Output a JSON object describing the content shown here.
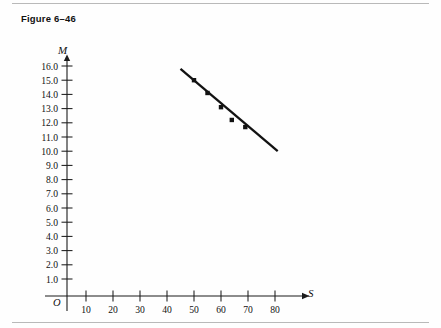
{
  "figure": {
    "caption": "Figure 6–46"
  },
  "axes": {
    "y_label": "M",
    "x_label": "S",
    "origin_label": "O"
  },
  "chart_data": {
    "type": "scatter",
    "title": "Figure 6–46",
    "xlabel": "S",
    "ylabel": "M",
    "grid": false,
    "legend": "none",
    "xlim": [
      0,
      90
    ],
    "ylim": [
      0,
      16.8
    ],
    "x_ticks": [
      10,
      20,
      30,
      40,
      50,
      60,
      70,
      80
    ],
    "x_tick_labels": [
      "10",
      "20",
      "30",
      "40",
      "50",
      "60",
      "70",
      "80"
    ],
    "y_ticks": [
      1.0,
      2.0,
      3.0,
      4.0,
      5.0,
      6.0,
      7.0,
      8.0,
      9.0,
      10.0,
      11.0,
      12.0,
      13.0,
      14.0,
      15.0,
      16.0
    ],
    "y_tick_labels": [
      "1.0",
      "2.0",
      "3.0",
      "4.0",
      "5.0",
      "6.0",
      "7.0",
      "8.0",
      "9.0",
      "10.0",
      "11.0",
      "12.0",
      "13.0",
      "14.0",
      "15.0",
      "16.0"
    ],
    "points": [
      {
        "x": 50,
        "y": 15.0
      },
      {
        "x": 55,
        "y": 14.1
      },
      {
        "x": 60,
        "y": 13.1
      },
      {
        "x": 64,
        "y": 12.2
      },
      {
        "x": 69,
        "y": 11.7
      }
    ],
    "trend_line": {
      "type": "line",
      "from": {
        "x": 45,
        "y": 15.8
      },
      "to": {
        "x": 81,
        "y": 10.0
      }
    }
  }
}
